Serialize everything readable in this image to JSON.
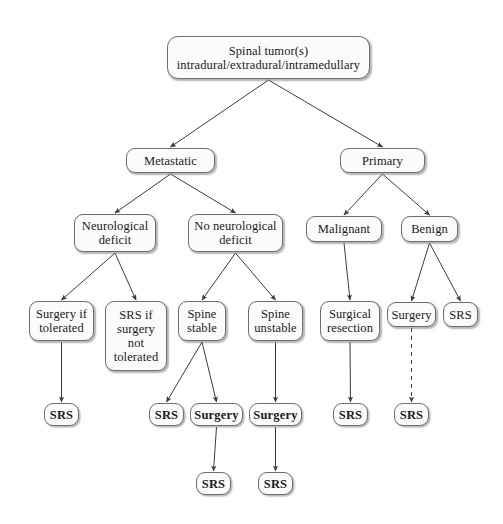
{
  "diagram": {
    "background_color": "#ffffff",
    "node_fill_color": "#fbfbfb",
    "node_border_color": "#6f6f6f",
    "edge_color": "#3c3c3c",
    "nodes": [
      {
        "id": "root",
        "label": "Spinal tumor(s)\nintradural/extradural/intramedullary",
        "x": 167,
        "y": 36,
        "w": 203,
        "h": 43,
        "bold": false,
        "level": 0
      },
      {
        "id": "metastatic",
        "label": "Metastatic",
        "x": 126,
        "y": 148,
        "w": 89,
        "h": 25,
        "bold": false,
        "level": 1
      },
      {
        "id": "primary",
        "label": "Primary",
        "x": 340,
        "y": 148,
        "w": 85,
        "h": 25,
        "bold": false,
        "level": 1
      },
      {
        "id": "neuro-deficit",
        "label": "Neurological\ndeficit",
        "x": 74,
        "y": 214,
        "w": 82,
        "h": 38,
        "bold": false,
        "level": 2
      },
      {
        "id": "no-neuro-deficit",
        "label": "No neurological\ndeficit",
        "x": 188,
        "y": 214,
        "w": 95,
        "h": 38,
        "bold": false,
        "level": 2
      },
      {
        "id": "malignant",
        "label": "Malignant",
        "x": 306,
        "y": 216,
        "w": 76,
        "h": 26,
        "bold": false,
        "level": 2
      },
      {
        "id": "benign",
        "label": "Benign",
        "x": 401,
        "y": 216,
        "w": 57,
        "h": 26,
        "bold": false,
        "level": 2
      },
      {
        "id": "surgery-if-tol",
        "label": "Surgery if\ntolerated",
        "x": 29,
        "y": 301,
        "w": 65,
        "h": 40,
        "bold": false,
        "level": 3
      },
      {
        "id": "srs-if-not-tol",
        "label": "SRS if\nsurgery\nnot\ntolerated",
        "x": 105,
        "y": 301,
        "w": 62,
        "h": 70,
        "bold": false,
        "level": 3
      },
      {
        "id": "spine-stable",
        "label": "Spine\nstable",
        "x": 178,
        "y": 301,
        "w": 48,
        "h": 40,
        "bold": false,
        "level": 3
      },
      {
        "id": "spine-unstable",
        "label": "Spine\nunstable",
        "x": 248,
        "y": 301,
        "w": 55,
        "h": 40,
        "bold": false,
        "level": 3
      },
      {
        "id": "surgical-resection",
        "label": "Surgical\nresection",
        "x": 320,
        "y": 301,
        "w": 60,
        "h": 40,
        "bold": false,
        "level": 3
      },
      {
        "id": "surgery-benign",
        "label": "Surgery",
        "x": 387,
        "y": 302,
        "w": 49,
        "h": 25,
        "bold": false,
        "level": 3
      },
      {
        "id": "srs-benign",
        "label": "SRS",
        "x": 443,
        "y": 302,
        "w": 35,
        "h": 25,
        "bold": false,
        "level": 3
      },
      {
        "id": "srs-1",
        "label": "SRS",
        "x": 44,
        "y": 403,
        "w": 35,
        "h": 23,
        "bold": true,
        "level": 4
      },
      {
        "id": "srs-2",
        "label": "SRS",
        "x": 149,
        "y": 403,
        "w": 35,
        "h": 23,
        "bold": true,
        "level": 4
      },
      {
        "id": "surgery-1",
        "label": "Surgery",
        "x": 190,
        "y": 403,
        "w": 53,
        "h": 23,
        "bold": true,
        "level": 4
      },
      {
        "id": "surgery-2",
        "label": "Surgery",
        "x": 249,
        "y": 403,
        "w": 53,
        "h": 23,
        "bold": true,
        "level": 4
      },
      {
        "id": "srs-3",
        "label": "SRS",
        "x": 333,
        "y": 403,
        "w": 35,
        "h": 23,
        "bold": true,
        "level": 4
      },
      {
        "id": "srs-4",
        "label": "SRS",
        "x": 394,
        "y": 403,
        "w": 35,
        "h": 23,
        "bold": true,
        "level": 4
      },
      {
        "id": "srs-5",
        "label": "SRS",
        "x": 196,
        "y": 472,
        "w": 35,
        "h": 23,
        "bold": true,
        "level": 5
      },
      {
        "id": "srs-6",
        "label": "SRS",
        "x": 258,
        "y": 472,
        "w": 35,
        "h": 23,
        "bold": true,
        "level": 5
      }
    ],
    "edges": [
      {
        "from": "root",
        "to": "metastatic",
        "style": "solid"
      },
      {
        "from": "root",
        "to": "primary",
        "style": "solid"
      },
      {
        "from": "metastatic",
        "to": "neuro-deficit",
        "style": "solid"
      },
      {
        "from": "metastatic",
        "to": "no-neuro-deficit",
        "style": "solid"
      },
      {
        "from": "primary",
        "to": "malignant",
        "style": "solid"
      },
      {
        "from": "primary",
        "to": "benign",
        "style": "solid"
      },
      {
        "from": "neuro-deficit",
        "to": "surgery-if-tol",
        "style": "solid"
      },
      {
        "from": "neuro-deficit",
        "to": "srs-if-not-tol",
        "style": "solid"
      },
      {
        "from": "no-neuro-deficit",
        "to": "spine-stable",
        "style": "solid"
      },
      {
        "from": "no-neuro-deficit",
        "to": "spine-unstable",
        "style": "solid"
      },
      {
        "from": "malignant",
        "to": "surgical-resection",
        "style": "solid"
      },
      {
        "from": "benign",
        "to": "surgery-benign",
        "style": "solid"
      },
      {
        "from": "benign",
        "to": "srs-benign",
        "style": "solid"
      },
      {
        "from": "surgery-if-tol",
        "to": "srs-1",
        "style": "solid"
      },
      {
        "from": "spine-stable",
        "to": "srs-2",
        "style": "solid"
      },
      {
        "from": "spine-stable",
        "to": "surgery-1",
        "style": "solid"
      },
      {
        "from": "spine-unstable",
        "to": "surgery-2",
        "style": "solid"
      },
      {
        "from": "surgical-resection",
        "to": "srs-3",
        "style": "solid"
      },
      {
        "from": "surgery-benign",
        "to": "srs-4",
        "style": "dashed"
      },
      {
        "from": "surgery-1",
        "to": "srs-5",
        "style": "solid"
      },
      {
        "from": "surgery-2",
        "to": "srs-6",
        "style": "solid"
      }
    ]
  }
}
